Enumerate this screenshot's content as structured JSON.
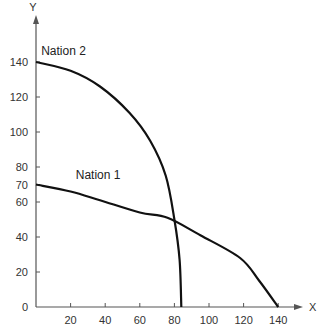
{
  "chart_data": {
    "type": "line",
    "title": "",
    "xlabel": "X",
    "ylabel": "Y",
    "xlim": [
      0,
      150
    ],
    "ylim": [
      0,
      155
    ],
    "grid": false,
    "legend": "inline labels",
    "x_ticks": [
      20,
      40,
      60,
      80,
      100,
      120,
      140
    ],
    "y_ticks": [
      0,
      20,
      40,
      60,
      70,
      80,
      100,
      120,
      140
    ],
    "series": [
      {
        "name": "Nation 2",
        "points": [
          [
            0,
            140
          ],
          [
            20,
            135
          ],
          [
            37,
            126
          ],
          [
            54,
            111
          ],
          [
            66,
            95
          ],
          [
            75,
            75
          ],
          [
            80,
            50
          ],
          [
            83,
            27
          ],
          [
            84,
            0
          ]
        ]
      },
      {
        "name": "Nation 1",
        "points": [
          [
            0,
            70
          ],
          [
            20,
            66
          ],
          [
            37,
            61
          ],
          [
            60,
            54
          ],
          [
            76,
            51
          ],
          [
            95,
            41
          ],
          [
            118,
            28
          ],
          [
            129,
            15
          ],
          [
            140,
            0
          ]
        ]
      }
    ],
    "annotations": [
      {
        "text": "Nation 2",
        "x": 3,
        "y": 144
      },
      {
        "text": "Nation 1",
        "x": 23,
        "y": 73
      }
    ]
  },
  "axes": {
    "x_label": "X",
    "y_label": "Y",
    "origin_label": "0"
  },
  "colors": {
    "line": "#111111",
    "axis": "#555555",
    "text": "#333333"
  }
}
